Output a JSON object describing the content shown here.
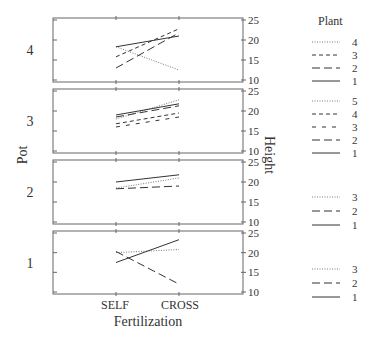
{
  "chart_data": {
    "type": "line",
    "title": "",
    "xlabel": "Fertilization",
    "ylabel_left": "Pot",
    "ylabel_right": "Height",
    "categories": [
      "SELF",
      "CROSS"
    ],
    "ylim": [
      10,
      25
    ],
    "yticks": [
      10,
      15,
      20,
      25
    ],
    "legend_title": "Plant",
    "panels": [
      {
        "pot": "4",
        "series": [
          {
            "plant": "4",
            "style": "dotted",
            "values": [
              18.3,
              12.5
            ]
          },
          {
            "plant": "3",
            "style": "dashed",
            "values": [
              15.8,
              22.8
            ]
          },
          {
            "plant": "2",
            "style": "longdash",
            "values": [
              13.0,
              21.8
            ]
          },
          {
            "plant": "1",
            "style": "solid",
            "values": [
              18.3,
              21.0
            ]
          }
        ]
      },
      {
        "pot": "3",
        "series": [
          {
            "plant": "5",
            "style": "dotted",
            "values": [
              18.0,
              22.8
            ]
          },
          {
            "plant": "4",
            "style": "dashed",
            "values": [
              16.8,
              19.5
            ]
          },
          {
            "plant": "3",
            "style": "sparsedash",
            "values": [
              16.0,
              18.5
            ]
          },
          {
            "plant": "2",
            "style": "longdash",
            "values": [
              18.5,
              21.3
            ]
          },
          {
            "plant": "1",
            "style": "solid",
            "values": [
              19.0,
              21.8
            ]
          }
        ]
      },
      {
        "pot": "2",
        "series": [
          {
            "plant": "3",
            "style": "dotted",
            "values": [
              18.5,
              21.0
            ]
          },
          {
            "plant": "2",
            "style": "longdash",
            "values": [
              18.3,
              19.0
            ]
          },
          {
            "plant": "1",
            "style": "solid",
            "values": [
              20.0,
              21.8
            ]
          }
        ]
      },
      {
        "pot": "1",
        "series": [
          {
            "plant": "3",
            "style": "dotted",
            "values": [
              20.0,
              20.8
            ]
          },
          {
            "plant": "2",
            "style": "longdash",
            "values": [
              20.3,
              12.0
            ]
          },
          {
            "plant": "1",
            "style": "solid",
            "values": [
              17.5,
              23.3
            ]
          }
        ]
      }
    ]
  },
  "labels": {
    "xlabel": "Fertilization",
    "ylabel_left": "Pot",
    "ylabel_right": "Height",
    "legend_title": "Plant",
    "cat_self": "SELF",
    "cat_cross": "CROSS"
  }
}
